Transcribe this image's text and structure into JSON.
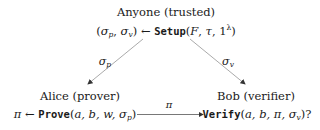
{
  "nodes": {
    "setup": {
      "title": "Anyone (trusted)",
      "output_open": "(",
      "output_sigma_p": "σ",
      "output_p": "p",
      "output_comma": ", ",
      "output_sigma_v": "σ",
      "output_v": "v",
      "output_close": ")",
      "arrow": " ← ",
      "func": "Setup",
      "args_open": "(",
      "arg_F": "F",
      "arg_sep1": ", ",
      "arg_tau": "τ",
      "arg_sep2": ", ",
      "arg_one": "1",
      "arg_lambda": "λ",
      "args_close": ")"
    },
    "prover": {
      "title": "Alice (prover)",
      "output": "π",
      "arrow": " ← ",
      "func": "Prove",
      "args_open": "(",
      "args": "a, b, w, σ",
      "args_sub": "p",
      "args_close": ")"
    },
    "verifier": {
      "title": "Bob (verifier)",
      "func": "Verify",
      "args_open": "(",
      "args": "a, b, π, σ",
      "args_sub": "v",
      "args_close": ")?"
    }
  },
  "edges": {
    "setup_to_prover": {
      "label": "σ",
      "label_sub": "p"
    },
    "setup_to_verifier": {
      "label": "σ",
      "label_sub": "v"
    },
    "prover_to_verifier": {
      "label": "π"
    }
  },
  "colors": {
    "arrow": "#9a9a9a",
    "text": "#1a1a1a"
  }
}
